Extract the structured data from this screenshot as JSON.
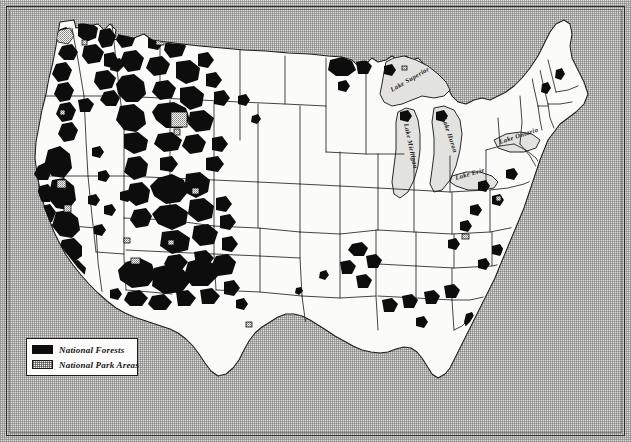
{
  "figure": {
    "background_color": "#dcdcd8",
    "land_color": "#fbfbfa",
    "forest_color": "#0d0d0d",
    "border_color": "#1d1d1d"
  },
  "legend": {
    "items": [
      {
        "swatch": "solid-black",
        "label": "National Forests"
      },
      {
        "swatch": "stippled-light",
        "label": "National Park Areas"
      }
    ]
  },
  "lake_labels": [
    {
      "name": "Lake Superior"
    },
    {
      "name": "Lake Michigan"
    },
    {
      "name": "Lake Huron"
    },
    {
      "name": "Lake Erie"
    },
    {
      "name": "Lake Ontario"
    }
  ]
}
